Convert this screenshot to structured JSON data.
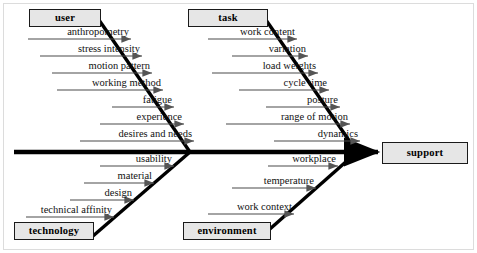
{
  "diagram": {
    "type": "fishbone-ishikawa",
    "effect": {
      "label": "support"
    },
    "colors": {
      "box_fill": "#e6e6e6",
      "box_border": "#1a1a1a",
      "spine": "#000000",
      "text": "#111111",
      "frame": "#d5d5d5"
    },
    "categories": [
      {
        "id": "user",
        "label": "user",
        "position": "top-left",
        "causes": [
          "anthropometry",
          "stress intensity",
          "motion pattern",
          "working method",
          "fatigue",
          "experience",
          "desires and needs"
        ]
      },
      {
        "id": "task",
        "label": "task",
        "position": "top-right",
        "causes": [
          "work content",
          "variation",
          "load weights",
          "cycle time",
          "posture",
          "range of motion",
          "dynamics"
        ]
      },
      {
        "id": "technology",
        "label": "technology",
        "position": "bottom-left",
        "causes": [
          "usability",
          "material",
          "design",
          "technical affinity"
        ]
      },
      {
        "id": "environment",
        "label": "environment",
        "position": "bottom-right",
        "causes": [
          "workplace",
          "temperature",
          "work context"
        ]
      }
    ]
  },
  "layout": {
    "boxes": {
      "user": {
        "x": 29,
        "y": 9,
        "w": 72,
        "h": 18
      },
      "task": {
        "x": 188,
        "y": 9,
        "w": 80,
        "h": 18
      },
      "technology": {
        "x": 14,
        "y": 222,
        "w": 80,
        "h": 18
      },
      "environment": {
        "x": 183,
        "y": 222,
        "w": 88,
        "h": 18
      },
      "support": {
        "x": 382,
        "y": 142,
        "w": 86,
        "h": 22
      }
    },
    "labels": {
      "user": [
        {
          "text": "anthropometry",
          "rx": 126,
          "ry": 39,
          "ux0": 28,
          "ux1": 131
        },
        {
          "text": "stress intensity",
          "rx": 137,
          "ry": 56,
          "ux0": 40,
          "ux1": 142
        },
        {
          "text": "motion pattern",
          "rx": 147,
          "ry": 73,
          "ux0": 52,
          "ux1": 152
        },
        {
          "text": "working method",
          "rx": 158,
          "ry": 90,
          "ux0": 57,
          "ux1": 163
        },
        {
          "text": "fatigue",
          "rx": 168,
          "ry": 107,
          "ux0": 112,
          "ux1": 174
        },
        {
          "text": "experience",
          "rx": 178,
          "ry": 124,
          "ux0": 100,
          "ux1": 184
        },
        {
          "text": "desires and needs",
          "rx": 188,
          "ry": 141,
          "ux0": 80,
          "ux1": 194
        }
      ],
      "task": [
        {
          "text": "work content",
          "rx": 292,
          "ry": 39,
          "ux0": 208,
          "ux1": 297
        },
        {
          "text": "variation",
          "rx": 303,
          "ry": 56,
          "ux0": 232,
          "ux1": 308
        },
        {
          "text": "load weights",
          "rx": 313,
          "ry": 73,
          "ux0": 212,
          "ux1": 318
        },
        {
          "text": "cycle time",
          "rx": 324,
          "ry": 90,
          "ux0": 239,
          "ux1": 329
        },
        {
          "text": "posture",
          "rx": 334,
          "ry": 107,
          "ux0": 266,
          "ux1": 340
        },
        {
          "text": "range of motion",
          "rx": 344,
          "ry": 124,
          "ux0": 226,
          "ux1": 350
        },
        {
          "text": "dynamics",
          "rx": 355,
          "ry": 141,
          "ux0": 274,
          "ux1": 360
        }
      ],
      "technology": [
        {
          "text": "usability",
          "rx": 168,
          "ry": 166,
          "ux0": 100,
          "ux1": 174
        },
        {
          "text": "material",
          "rx": 148,
          "ry": 183,
          "ux0": 84,
          "ux1": 154
        },
        {
          "text": "design",
          "rx": 128,
          "ry": 200,
          "ux0": 70,
          "ux1": 134
        },
        {
          "text": "technical affinity",
          "rx": 108,
          "ry": 217,
          "ux0": 26,
          "ux1": 114
        }
      ],
      "environment": [
        {
          "text": "workplace",
          "rx": 332,
          "ry": 166,
          "ux0": 268,
          "ux1": 338
        },
        {
          "text": "temperature",
          "rx": 310,
          "ry": 188,
          "ux0": 232,
          "ux1": 316
        },
        {
          "text": "work context",
          "rx": 288,
          "ry": 214,
          "ux0": 208,
          "ux1": 294
        }
      ]
    }
  }
}
